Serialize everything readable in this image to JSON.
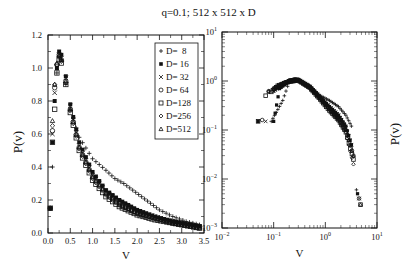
{
  "figure_title": "q=0.1; 512 x 512 x D",
  "chart_data": [
    {
      "type": "scatter",
      "panel": "left",
      "title": "q=0.1; 512 x 512 x D",
      "xlabel": "v",
      "ylabel": "P(v)",
      "xscale": "linear",
      "yscale": "linear",
      "xlim": [
        0.0,
        3.5
      ],
      "ylim": [
        0.0,
        1.2
      ],
      "xticks": [
        "0.0",
        "0.5",
        "1.0",
        "1.5",
        "2.0",
        "2.5",
        "3.0",
        "3.5"
      ],
      "yticks": [
        "0.0",
        "0.2",
        "0.4",
        "0.6",
        "0.8",
        "1.0",
        "1.2"
      ],
      "grid": false,
      "legend_position": "upper right",
      "legend": [
        {
          "label": "D=  8",
          "marker": "plus"
        },
        {
          "label": "D= 16",
          "marker": "filled-square"
        },
        {
          "label": "D= 32",
          "marker": "cross"
        },
        {
          "label": "D= 64",
          "marker": "circle"
        },
        {
          "label": "D=128",
          "marker": "square"
        },
        {
          "label": "D=256",
          "marker": "diamond"
        },
        {
          "label": "D=512",
          "marker": "triangle"
        }
      ],
      "series": [
        {
          "name": "D=8",
          "marker": "plus",
          "x": [
            0.05,
            0.1,
            0.2,
            0.25,
            0.3,
            0.4,
            0.5,
            0.7,
            1.0,
            1.3,
            1.5,
            1.7,
            1.9,
            2.1,
            2.3,
            2.5,
            2.8,
            3.1,
            3.4
          ],
          "y": [
            0.15,
            0.4,
            0.97,
            1.06,
            1.05,
            0.9,
            0.75,
            0.58,
            0.45,
            0.38,
            0.33,
            0.3,
            0.26,
            0.22,
            0.18,
            0.14,
            0.1,
            0.07,
            0.05
          ]
        },
        {
          "name": "D=16",
          "marker": "filled-square",
          "x": [
            0.05,
            0.1,
            0.15,
            0.2,
            0.25,
            0.3,
            0.4,
            0.5,
            0.7,
            1.0,
            1.3,
            1.6,
            2.0,
            2.4,
            2.8,
            3.2,
            3.4
          ],
          "y": [
            0.15,
            0.55,
            0.8,
            1.0,
            1.1,
            1.08,
            0.95,
            0.78,
            0.55,
            0.37,
            0.26,
            0.2,
            0.14,
            0.1,
            0.07,
            0.05,
            0.04
          ]
        },
        {
          "name": "D=32",
          "marker": "cross",
          "x": [
            0.05,
            0.1,
            0.15,
            0.2,
            0.25,
            0.3,
            0.4,
            0.5,
            0.7,
            1.0,
            1.3,
            1.6,
            2.0,
            2.4,
            2.8,
            3.2,
            3.4
          ],
          "y": [
            0.15,
            0.6,
            0.85,
            1.0,
            1.08,
            1.06,
            0.94,
            0.77,
            0.53,
            0.35,
            0.25,
            0.19,
            0.13,
            0.1,
            0.07,
            0.05,
            0.04
          ]
        },
        {
          "name": "D=64",
          "marker": "circle",
          "x": [
            0.05,
            0.1,
            0.15,
            0.2,
            0.25,
            0.3,
            0.4,
            0.5,
            0.7,
            1.0,
            1.3,
            1.6,
            2.0,
            2.4,
            2.8,
            3.2,
            3.4
          ],
          "y": [
            0.15,
            0.62,
            0.88,
            1.02,
            1.08,
            1.05,
            0.92,
            0.75,
            0.52,
            0.34,
            0.24,
            0.18,
            0.12,
            0.09,
            0.07,
            0.05,
            0.04
          ]
        },
        {
          "name": "D=128",
          "marker": "square",
          "x": [
            0.05,
            0.1,
            0.15,
            0.2,
            0.25,
            0.3,
            0.4,
            0.5,
            0.7,
            1.0,
            1.3,
            1.6,
            2.0,
            2.4,
            2.8,
            3.2,
            3.4
          ],
          "y": [
            0.15,
            0.55,
            0.75,
            0.97,
            1.05,
            1.03,
            0.9,
            0.73,
            0.5,
            0.32,
            0.22,
            0.16,
            0.11,
            0.08,
            0.06,
            0.04,
            0.03
          ]
        },
        {
          "name": "D=256",
          "marker": "diamond",
          "x": [
            0.1,
            0.15,
            0.2,
            0.25,
            0.3,
            0.4,
            0.5,
            0.7,
            1.0,
            1.3,
            1.6,
            2.0,
            2.4,
            2.8,
            3.2,
            3.4
          ],
          "y": [
            0.65,
            0.9,
            1.02,
            1.07,
            1.04,
            0.91,
            0.74,
            0.51,
            0.33,
            0.23,
            0.17,
            0.12,
            0.09,
            0.06,
            0.04,
            0.03
          ]
        },
        {
          "name": "D=512",
          "marker": "triangle",
          "x": [
            0.1,
            0.15,
            0.2,
            0.25,
            0.3,
            0.4,
            0.5,
            0.7,
            1.0,
            1.3,
            1.6,
            2.0,
            2.4,
            2.8,
            3.2,
            3.4
          ],
          "y": [
            0.68,
            0.9,
            1.03,
            1.08,
            1.05,
            0.92,
            0.75,
            0.52,
            0.34,
            0.24,
            0.17,
            0.12,
            0.09,
            0.06,
            0.04,
            0.03
          ]
        }
      ]
    },
    {
      "type": "scatter",
      "panel": "right",
      "xlabel": "v",
      "ylabel": "P(v)",
      "xscale": "log",
      "yscale": "log",
      "xlim": [
        0.01,
        10
      ],
      "ylim": [
        0.001,
        10
      ],
      "xticks": [
        "10^-2",
        "10^-1",
        "10^0",
        "10^1"
      ],
      "yticks": [
        "10^-3",
        "10^-2",
        "10^-1",
        "10^0",
        "10^1"
      ],
      "grid": false,
      "series": [
        {
          "name": "D=8",
          "marker": "plus",
          "x": [
            0.09,
            0.15,
            0.2,
            0.3,
            0.5,
            0.8,
            1.2,
            1.8,
            2.5,
            3.2,
            4.0
          ],
          "y": [
            0.15,
            0.4,
            0.97,
            1.05,
            0.8,
            0.5,
            0.4,
            0.3,
            0.2,
            0.12,
            0.006
          ]
        },
        {
          "name": "D=16",
          "marker": "filled-square",
          "x": [
            0.05,
            0.1,
            0.13,
            0.2,
            0.25,
            0.3,
            0.5,
            0.8,
            1.2,
            1.8,
            2.5,
            3.2,
            4.2
          ],
          "y": [
            0.15,
            0.15,
            0.7,
            1.0,
            1.1,
            1.08,
            0.78,
            0.45,
            0.3,
            0.2,
            0.12,
            0.05,
            0.005
          ]
        },
        {
          "name": "D=32",
          "marker": "cross",
          "x": [
            0.07,
            0.1,
            0.15,
            0.2,
            0.3,
            0.5,
            0.8,
            1.2,
            1.8,
            2.5,
            3.2,
            4.5
          ],
          "y": [
            0.15,
            0.62,
            0.85,
            1.0,
            1.06,
            0.77,
            0.45,
            0.3,
            0.2,
            0.11,
            0.05,
            0.004
          ]
        },
        {
          "name": "D=64",
          "marker": "circle",
          "x": [
            0.06,
            0.08,
            0.1,
            0.15,
            0.2,
            0.3,
            0.5,
            0.8,
            1.2,
            1.8,
            2.5,
            3.5,
            4.5
          ],
          "y": [
            0.16,
            0.62,
            0.7,
            0.88,
            1.02,
            1.05,
            0.75,
            0.45,
            0.28,
            0.18,
            0.1,
            0.03,
            0.004
          ]
        },
        {
          "name": "D=128",
          "marker": "square",
          "x": [
            0.05,
            0.07,
            0.09,
            0.12,
            0.2,
            0.3,
            0.5,
            0.8,
            1.2,
            1.8,
            2.5,
            3.5,
            4.8
          ],
          "y": [
            0.15,
            0.5,
            0.6,
            0.8,
            0.97,
            1.03,
            0.73,
            0.42,
            0.25,
            0.16,
            0.09,
            0.025,
            0.003
          ]
        },
        {
          "name": "D=256",
          "marker": "diamond",
          "x": [
            0.08,
            0.1,
            0.15,
            0.2,
            0.3,
            0.5,
            0.8,
            1.2,
            1.8,
            2.5,
            3.5
          ],
          "y": [
            0.62,
            0.65,
            0.9,
            1.02,
            1.04,
            0.74,
            0.43,
            0.26,
            0.16,
            0.09,
            0.02
          ]
        },
        {
          "name": "D=512",
          "marker": "triangle",
          "x": [
            0.08,
            0.1,
            0.15,
            0.2,
            0.3,
            0.5,
            0.8,
            1.2,
            1.8,
            2.5,
            3.5,
            4.8
          ],
          "y": [
            0.6,
            0.68,
            0.9,
            1.03,
            1.05,
            0.75,
            0.44,
            0.27,
            0.17,
            0.1,
            0.03,
            0.003
          ]
        }
      ]
    }
  ]
}
